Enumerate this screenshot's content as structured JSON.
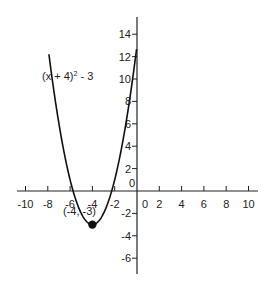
{
  "chart_data": {
    "type": "line",
    "title": "",
    "xlabel": "",
    "ylabel": "",
    "xlim": [
      -10.8,
      10.8
    ],
    "ylim": [
      -7.5,
      15.5
    ],
    "grid": false,
    "x_ticks": [
      -10,
      -8,
      -6,
      -4,
      -2,
      0,
      2,
      4,
      6,
      8,
      10
    ],
    "y_ticks": [
      -6,
      -4,
      -2,
      0,
      2,
      4,
      6,
      8,
      10,
      12,
      14
    ],
    "series": [
      {
        "name": "(x + 4)² - 3",
        "function": "(x + 4)^2 - 3",
        "x_range": [
          -7.9,
          1.8
        ],
        "x": [
          -7.9,
          -7,
          -6,
          -5,
          -4,
          -3,
          -2,
          -1,
          0,
          1,
          1.8
        ],
        "values": [
          12.21,
          6,
          1,
          -2,
          -3,
          -2,
          1,
          6,
          13,
          22,
          30.64
        ]
      }
    ],
    "points": [
      {
        "x": -4,
        "y": -3,
        "label": "(-4, -3)"
      }
    ],
    "annotations": [
      {
        "text": "(x + 4)² - 3",
        "x": -8.5,
        "y": 10.3
      },
      {
        "text": "(-4, -3)",
        "x": -4,
        "y": -4.8
      }
    ]
  },
  "labels": {
    "function_label": "(x + 4)",
    "function_exp": "2",
    "function_tail": " - 3",
    "vertex_label": "(-4, -3)"
  }
}
